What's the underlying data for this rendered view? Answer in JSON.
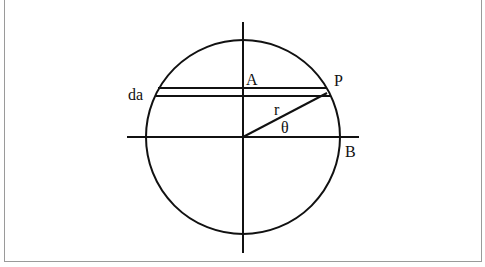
{
  "diagram": {
    "labels": {
      "A": "A",
      "P": "P",
      "da": "da",
      "r": "r",
      "theta": "θ",
      "B": "B"
    },
    "colors": {
      "stroke": "#111111",
      "frame": "#9a9a9a",
      "background": "#ffffff"
    },
    "geometry": {
      "center": [
        243,
        137
      ],
      "radius": 97,
      "strip_top_y": 88,
      "strip_bottom_y": 96,
      "point_P": [
        327,
        92
      ]
    }
  }
}
